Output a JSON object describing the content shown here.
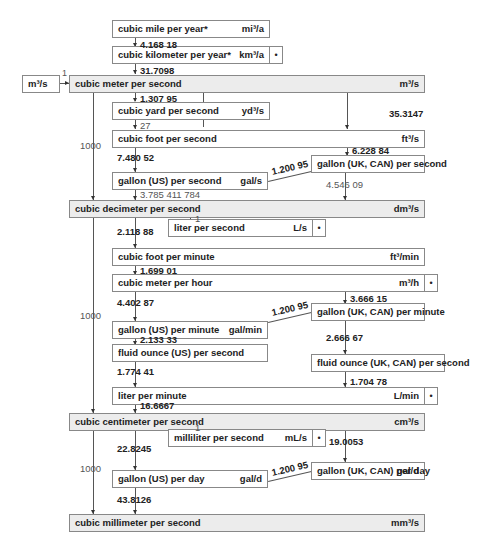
{
  "input_box": {
    "unit": "m³/s",
    "factor": "1"
  },
  "units": {
    "mi3a": {
      "label": "cubic mile per year*",
      "symbol": "mi³/a"
    },
    "km3a": {
      "label": "cubic kilometer per year*",
      "symbol": "km³/a",
      "dot": "•"
    },
    "m3s": {
      "label": "cubic meter per second",
      "symbol": "m³/s"
    },
    "yd3s": {
      "label": "cubic yard per second",
      "symbol": "yd³/s"
    },
    "ft3s": {
      "label": "cubic foot per second",
      "symbol": "ft³/s"
    },
    "galus_s": {
      "label": "gallon (US) per second",
      "symbol": "gal/s"
    },
    "galuk_s": {
      "label": "gallon (UK, CAN) per second",
      "symbol": ""
    },
    "dm3s": {
      "label": "cubic decimeter per second",
      "symbol": "dm³/s"
    },
    "ls": {
      "label": "liter per second",
      "symbol": "L/s",
      "dot": "•"
    },
    "ft3min": {
      "label": "cubic foot per minute",
      "symbol": "ft³/min"
    },
    "m3h": {
      "label": "cubic meter per hour",
      "symbol": "m³/h",
      "dot": "•"
    },
    "galus_min": {
      "label": "gallon (US) per minute",
      "symbol": "gal/min"
    },
    "galuk_min": {
      "label": "gallon (UK, CAN) per minute",
      "symbol": ""
    },
    "flozus_s": {
      "label": "fluid ounce (US) per second",
      "symbol": ""
    },
    "flozuk_s": {
      "label": "fluid ounce (UK, CAN) per second",
      "symbol": ""
    },
    "lmin": {
      "label": "liter per minute",
      "symbol": "L/min",
      "dot": "•"
    },
    "cm3s": {
      "label": "cubic centimeter per second",
      "symbol": "cm³/s"
    },
    "mls": {
      "label": "milliliter per second",
      "symbol": "mL/s",
      "dot": "•"
    },
    "galus_d": {
      "label": "gallon (US) per day",
      "symbol": "gal/d"
    },
    "galuk_d": {
      "label": "gallon (UK, CAN) per day",
      "symbol": "gal/d"
    },
    "mm3s": {
      "label": "cubic millimeter per second",
      "symbol": "mm³/s"
    }
  },
  "factors": {
    "mi_to_km": "4.168 18",
    "km_to_m3s": "31.7098",
    "m3s_to_yd3s": "1.307 95",
    "yd3s_to_ft3s": "27",
    "m3s_to_ft3s": "35.3147",
    "ft3s_to_galus": "7.480 52",
    "ft3s_to_galuk": "6.228 84",
    "galus_galuk_s": "1.200 95",
    "galus_to_dm3": "3.785 411 784",
    "galuk_to_dm3": "4.546 09",
    "m3s_to_dm3s": "1000",
    "dm3s_to_ls": "1",
    "dm3s_to_ft3min": "2.118 88",
    "ft3min_to_m3h": "1.699 01",
    "m3h_to_galusmin": "4.402 87",
    "m3h_to_galukmin": "3.666 15",
    "galus_galuk_min": "1.200 95",
    "galusmin_to_flozus": "2.133 33",
    "galukmin_to_flozuk": "2.666 67",
    "flozus_to_lmin": "1.774 41",
    "flozuk_to_lmin": "1.704 78",
    "lmin_to_cm3s": "16.6667",
    "dm3s_to_cm3s": "1000",
    "cm3s_to_mls": "1",
    "cm3s_to_galusd": "22.8245",
    "cm3s_to_galukd": "19.0053",
    "galus_galuk_d": "1.200 95",
    "galusd_to_mm3s": "43.8126",
    "cm3s_to_mm3s": "1000"
  }
}
